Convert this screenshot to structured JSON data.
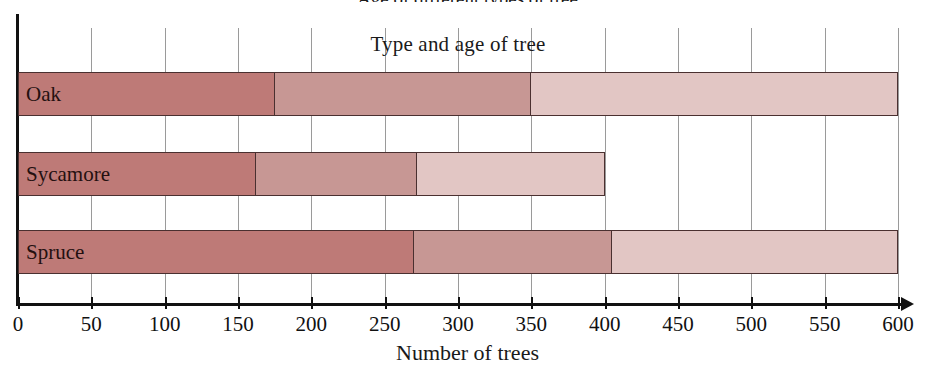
{
  "clipped_top_title": "Age of different types of tree",
  "chart_data": {
    "type": "bar",
    "orientation": "horizontal",
    "stacked": true,
    "title": "Type and age of tree",
    "xlabel": "Number of trees",
    "ylabel": "",
    "xlim": [
      0,
      600
    ],
    "xticks": [
      0,
      50,
      100,
      150,
      200,
      250,
      300,
      350,
      400,
      450,
      500,
      550,
      600
    ],
    "xtick_labels": [
      "0",
      "50",
      "100",
      "150",
      "200",
      "250",
      "300",
      "350",
      "400",
      "450",
      "500",
      "550",
      "600"
    ],
    "grid": true,
    "grid_axis": "x",
    "legend": false,
    "categories": [
      "Oak",
      "Sycamore",
      "Spruce"
    ],
    "series": [
      {
        "name": "segment-1",
        "color": "#be7a77",
        "values": [
          175,
          162,
          270
        ]
      },
      {
        "name": "segment-2",
        "color": "#c79794",
        "values": [
          175,
          110,
          135
        ]
      },
      {
        "name": "segment-3",
        "color": "#e2c6c4",
        "values": [
          250,
          128,
          195
        ]
      }
    ],
    "bar_totals": [
      600,
      400,
      600
    ],
    "segment_boundaries": {
      "Oak": [
        175,
        350,
        600
      ],
      "Sycamore": [
        162,
        272,
        400
      ],
      "Spruce": [
        270,
        405,
        600
      ]
    }
  },
  "colors": {
    "dark": "#be7a77",
    "medium": "#c79794",
    "light": "#e2c6c4",
    "outline": "#4a3030",
    "grid": "#9a9a9a",
    "axis": "#111111"
  }
}
